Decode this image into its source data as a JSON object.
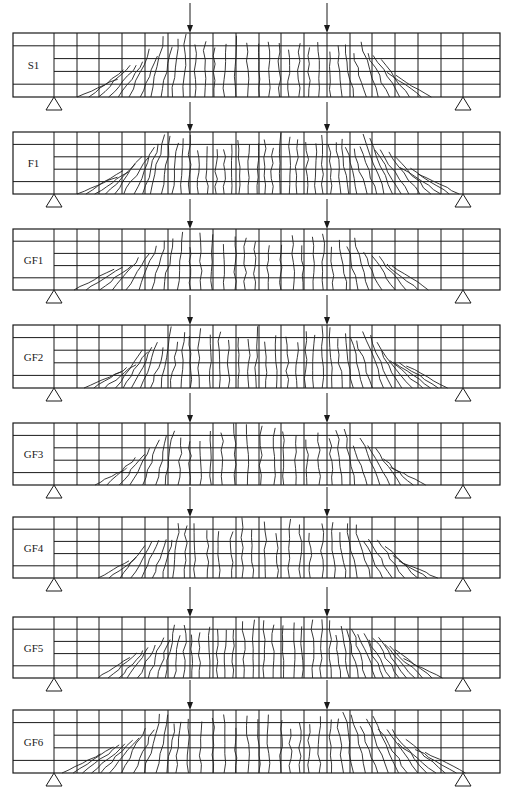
{
  "figure": {
    "type": "beam crack pattern diagram",
    "line_color": "#1a1a1a",
    "crack_color": "#222222",
    "grid": {
      "x_left": 13,
      "x_right": 500,
      "label_panel_right": 54,
      "vertical_lines": [
        54,
        77,
        99,
        122,
        145,
        168,
        190,
        213,
        236,
        259,
        281,
        304,
        327,
        350,
        372,
        395,
        418,
        441,
        463
      ],
      "horizontal_bands": 5
    },
    "supports_x": [
      54,
      463
    ],
    "loads_x": [
      190,
      327
    ],
    "beams": [
      {
        "label": "S1",
        "top": 33,
        "bottom": 97
      },
      {
        "label": "F1",
        "top": 132,
        "bottom": 194
      },
      {
        "label": "GF1",
        "top": 229,
        "bottom": 290
      },
      {
        "label": "GF2",
        "top": 325,
        "bottom": 388
      },
      {
        "label": "GF3",
        "top": 423,
        "bottom": 485
      },
      {
        "label": "GF4",
        "top": 517,
        "bottom": 578
      },
      {
        "label": "GF5",
        "top": 617,
        "bottom": 678
      },
      {
        "label": "GF6",
        "top": 710,
        "bottom": 773
      }
    ],
    "crack_extent": [
      {
        "label": "S1",
        "from": 77,
        "to": 440
      },
      {
        "label": "F1",
        "from": 77,
        "to": 462
      },
      {
        "label": "GF1",
        "from": 74,
        "to": 438
      },
      {
        "label": "GF2",
        "from": 84,
        "to": 452
      },
      {
        "label": "GF3",
        "from": 95,
        "to": 432
      },
      {
        "label": "GF4",
        "from": 98,
        "to": 442
      },
      {
        "label": "GF5",
        "from": 98,
        "to": 448
      },
      {
        "label": "GF6",
        "from": 62,
        "to": 468
      }
    ]
  }
}
